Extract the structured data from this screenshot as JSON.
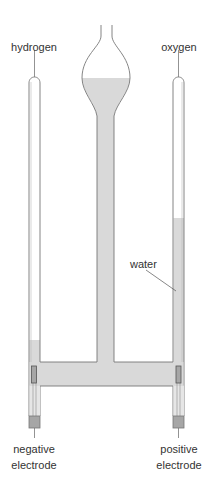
{
  "diagram": {
    "type": "Hofmann voltameter (electrolysis of water)",
    "labels": {
      "hydrogen": "hydrogen",
      "oxygen": "oxygen",
      "water": "water",
      "negative_electrode_line1": "negative",
      "negative_electrode_line2": "electrode",
      "positive_electrode_line1": "positive",
      "positive_electrode_line2": "electrode"
    },
    "colors": {
      "water": "#d9d9d9",
      "outline": "#777777",
      "electrode": "#a6a6a6",
      "text": "#333333"
    }
  }
}
